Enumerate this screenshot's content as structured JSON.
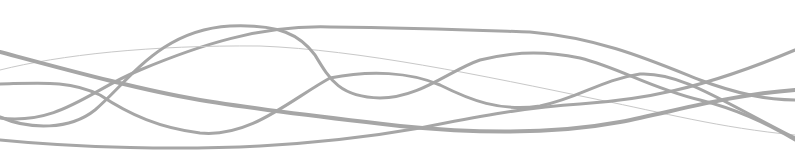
{
  "graphic": {
    "description": "decorative wavy lines",
    "stroke_color": "#a6a6a6",
    "thin_stroke_color": "#c8c8c8",
    "background": "#ffffff",
    "curves": [
      {
        "id": "wave-high-arc",
        "width": 3,
        "d": "M0,118 C60,125 90,90 140,70 C200,45 260,25 330,27 C420,28 470,30 530,32 C600,38 650,60 700,80 C740,95 770,100 795,100"
      },
      {
        "id": "wave-thin-guide",
        "width": 1,
        "d": "M0,70 C60,55 150,45 260,46 C360,50 480,75 600,100 C660,112 720,128 795,135"
      },
      {
        "id": "wave-upper-bump",
        "width": 3,
        "d": "M0,117 C30,130 70,130 95,110 C130,80 160,30 230,26 C280,24 300,35 315,55 C330,80 340,97 380,98 C420,98 450,70 480,60 C520,50 550,52 580,58 C620,68 650,88 700,100 C740,110 770,125 795,140"
      },
      {
        "id": "wave-descending",
        "width": 4,
        "d": "M0,52 C60,68 140,90 200,100 C260,110 330,118 400,126 C470,133 550,135 620,122 C680,110 730,95 795,90"
      },
      {
        "id": "wave-mid",
        "width": 3,
        "d": "M0,84 C40,83 70,80 100,95 C130,115 160,128 200,133 C250,138 290,100 330,78 C370,70 410,72 440,85 C470,100 500,112 540,106 C580,98 600,80 640,74 C680,72 720,100 795,138"
      },
      {
        "id": "wave-low-rise",
        "width": 3,
        "d": "M0,140 C80,148 180,150 260,146 C330,142 380,135 420,128 C470,118 520,108 580,104 C640,100 700,90 795,50"
      }
    ]
  }
}
